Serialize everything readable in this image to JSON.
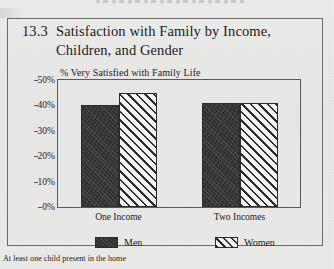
{
  "figure": {
    "number": "13.3",
    "title_line1": "Satisfaction with Family by Income,",
    "title_line2": "Children, and Gender",
    "footnote": "At least one child present in the home"
  },
  "legend": {
    "items": [
      {
        "label": "Men",
        "pattern": "solid-dark",
        "color": "#2f2f2f"
      },
      {
        "label": "Women",
        "pattern": "diagonal-hatch",
        "color": "#f2f2f0"
      }
    ]
  },
  "chart_data": {
    "type": "bar",
    "subtitle": "% Very Satisfied with Family Life",
    "xlabel": "",
    "ylabel": "",
    "categories": [
      "One Income",
      "Two Incomes"
    ],
    "series": [
      {
        "name": "Men",
        "values": [
          40,
          41
        ]
      },
      {
        "name": "Women",
        "values": [
          45,
          41
        ]
      }
    ],
    "ylim": [
      0,
      50
    ],
    "ytick_labels": [
      "0%",
      "10%",
      "20%",
      "30%",
      "40%",
      "50%"
    ],
    "ytick_values": [
      0,
      10,
      20,
      30,
      40,
      50
    ],
    "grid": false,
    "legend_position": "bottom",
    "annotations": [
      "At least one child present in the home"
    ]
  }
}
